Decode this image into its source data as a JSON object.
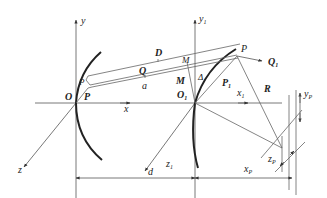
{
  "diagram": {
    "type": "optical-geometry",
    "labels": {
      "y": "y",
      "x": "x",
      "z": "z",
      "O": "O",
      "P_left": "P",
      "P_small": "P",
      "D": "D",
      "Q": "Q",
      "a": "a",
      "M_small": "M",
      "M": "M",
      "Delta": "Δ",
      "y1": "y",
      "y1_sub": "1",
      "O1": "O",
      "O1_sub": "1",
      "x1": "x",
      "x1_sub": "1",
      "z1": "z",
      "z1_sub": "1",
      "P_top": "P",
      "Q1": "Q",
      "Q1_sub": "1",
      "P1": "P",
      "P1_sub": "1",
      "R": "R",
      "yP": "y",
      "yP_sub": "P",
      "zP": "z",
      "zP_sub": "P",
      "d": "d",
      "xP": "x",
      "xP_sub": "P"
    },
    "colors": {
      "line": "#555555",
      "mirror": "#222222",
      "text": "#222222",
      "background": "#ffffff"
    }
  }
}
